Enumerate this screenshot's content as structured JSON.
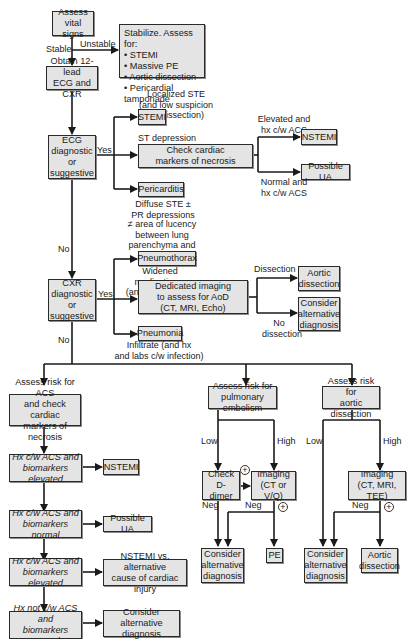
{
  "diagram": {
    "type": "clinical-flowchart",
    "topic": "Evaluation of chest pain",
    "colors": {
      "box_fill": "#e4e4e4",
      "box_border": "#2a2a2a",
      "line": "#1a1a1a",
      "background": "#ffffff"
    }
  },
  "nodes": {
    "assess_vitals": "Assess\nvital signs",
    "stabilize": "Stabilize. Assess for:\n• STEMI\n• Massive PE\n• Aortic dissection\n• Pericardial tamponade",
    "obtain_ecg_cxr": "Obtain 12-lead\nECG and CXR",
    "ecg_diag": "ECG\ndiagnostic\nor\nsuggestive",
    "stemi": "STEMI",
    "check_markers": "Check cardiac\nmarkers of necrosis",
    "pericarditis": "Pericarditis",
    "nstemi_top": "NSTEMI",
    "possible_ua_top": "Possible UA",
    "cxr_diag": "CXR\ndiagnostic\nor\nsuggestive",
    "pneumothorax": "Pneumothorax",
    "dedicated_imaging": "Dedicated imaging\nto assess for AoD\n(CT, MRI, Echo)",
    "pneumonia": "Pneumonia",
    "aortic_dissection_top": "Aortic\ndissection",
    "consider_alt_top": "Consider\nalternative\ndiagnosis",
    "assess_acs": "Assess risk for ACS\nand check cardiac\nmarkers of necrosis",
    "hx_acs_elev_1": "Hx c/w ACS and\nbiomarkers elevated",
    "nstemi_bottom": "NSTEMI",
    "hx_acs_normal": "Hx c/w ACS and\nbiomarkers normal",
    "possible_ua_bottom": "Possible UA",
    "hx_acs_elev_2": "Hx c/w ACS and\nbiomarkers elevated",
    "nstemi_vs_alt": "NSTEMI vs. alternative\ncause of cardiac injury",
    "hx_not_acs_normal": "Hx not c/w ACS and\nbiomarkers normal",
    "consider_alt_acs": "Consider alternative\ndiagnosis",
    "assess_pe": "Assess risk for\npulmonary embolism",
    "check_ddimer": "Check\nD-dimer",
    "imaging_pe": "Imaging\n(CT or V/Q)",
    "consider_alt_pe": "Consider\nalternative\ndiagnosis",
    "pe": "PE",
    "assess_aod": "Assess risk for\naortic dissection",
    "imaging_aod": "Imaging\n(CT, MRI, TEE)",
    "consider_alt_aod": "Consider\nalternative\ndiagnosis",
    "aortic_dissection_bottom": "Aortic\ndissection"
  },
  "edge_labels": {
    "stable": "Stable",
    "unstable": "Unstable",
    "localized_ste": "Localized STE\n(and low suspicion\nfor dissection)",
    "ecg_yes": "Yes",
    "st_depression": "ST depression\nand/or TWI",
    "diffuse_ste": "Diffuse STE ±\nPR depressions",
    "elevated_hx": "Elevated and\nhx c/w ACS",
    "normal_hx": "Normal and\nhx c/w ACS",
    "ecg_no": "No",
    "lucency": "≠ area of lucency\nbetween lung\nparenchyma and\nchest wall",
    "cxr_yes": "Yes",
    "widened": "Widened\nmediastinum\n(and hx c/w AoD)",
    "infiltrate": "Infiltrate (and hx\nand labs c/w infection)",
    "dissection": "Dissection",
    "no_dissection": "No\ndissection",
    "cxr_no": "No",
    "pe_low": "Low",
    "pe_high": "High",
    "pe_ddimer_plus": "+",
    "pe_neg_ddimer": "Neg",
    "pe_neg_imaging": "Neg",
    "pe_imaging_plus": "+",
    "aod_low": "Low",
    "aod_high": "High",
    "aod_neg": "Neg",
    "aod_plus": "+"
  }
}
